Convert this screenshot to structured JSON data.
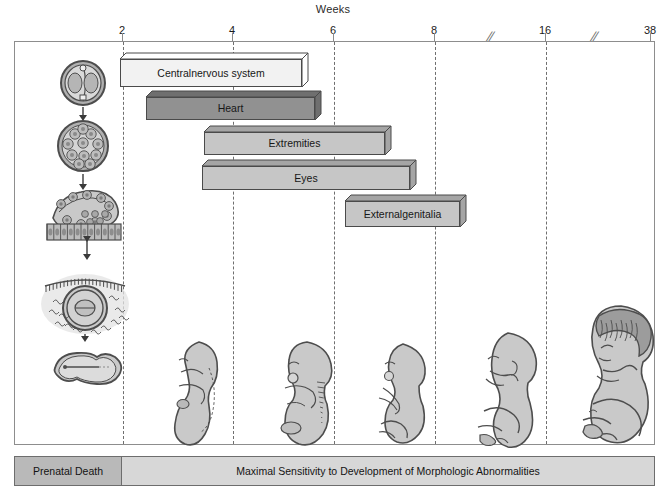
{
  "figure": {
    "axis_title": "Weeks",
    "bottom_bands": {
      "left_label": "Prenatal Death",
      "right_label": "Maximal Sensitivity to Development of Morphologic Abnormalities"
    }
  },
  "chart_data": {
    "type": "bar",
    "title": "Weeks",
    "xlabel": "Weeks",
    "ylabel": "",
    "orientation": "horizontal",
    "grid": true,
    "legend_position": "none",
    "axis_ticks": [
      {
        "label": "2",
        "x_px": 122
      },
      {
        "label": "4",
        "x_px": 232
      },
      {
        "label": "6",
        "x_px": 333
      },
      {
        "label": "8",
        "x_px": 434
      },
      {
        "label": "16",
        "x_px": 545
      },
      {
        "label": "38",
        "x_px": 650
      }
    ],
    "axis_breaks_px": [
      490,
      594
    ],
    "categories": [
      "Central nervous system",
      "Heart",
      "Extremities",
      "Eyes",
      "External genitalia"
    ],
    "bars": [
      {
        "label": "Central nervous system",
        "label_lines": [
          "Central",
          "nervous system"
        ],
        "start_week": 3.0,
        "end_week": 6.7,
        "x_px": 119,
        "width_px": 188,
        "y_px": 52,
        "height_px": 34,
        "fill": "#f2f2f2",
        "shade": "#ffffff"
      },
      {
        "label": "Heart",
        "label_lines": [
          "Heart"
        ],
        "start_week": 3.5,
        "end_week": 7.0,
        "x_px": 145,
        "width_px": 175,
        "y_px": 90,
        "height_px": 29,
        "fill": "#919191",
        "shade": "#6f6f6f"
      },
      {
        "label": "Extremities",
        "label_lines": [
          "Extremities"
        ],
        "start_week": 4.6,
        "end_week": 8.2,
        "x_px": 203,
        "width_px": 187,
        "y_px": 125,
        "height_px": 29,
        "fill": "#c6c6c6",
        "shade": "#a5a5a5"
      },
      {
        "label": "Eyes",
        "label_lines": [
          "Eyes"
        ],
        "start_week": 4.6,
        "end_week": 8.7,
        "x_px": 201,
        "width_px": 214,
        "y_px": 159,
        "height_px": 30,
        "fill": "#c6c6c6",
        "shade": "#a5a5a5"
      },
      {
        "label": "External genitalia",
        "label_lines": [
          "External",
          "genitalia"
        ],
        "start_week": 6.8,
        "end_week": 9.8,
        "x_px": 344,
        "width_px": 121,
        "y_px": 194,
        "height_px": 32,
        "fill": "#c6c6c6",
        "shade": "#a5a5a5"
      }
    ],
    "stage_illustrations": [
      {
        "name": "zygote",
        "stage": "zygote"
      },
      {
        "name": "morula",
        "stage": "morula"
      },
      {
        "name": "implanting-blastocyst",
        "stage": "blastocyst"
      },
      {
        "name": "implanted-embryo",
        "stage": "implanted embryo"
      },
      {
        "name": "bilaminar-disc",
        "stage": "embryonic disc"
      },
      {
        "name": "embryo-week3",
        "stage": "week 3 embryo"
      },
      {
        "name": "embryo-week4",
        "stage": "week 4 embryo"
      },
      {
        "name": "embryo-week5",
        "stage": "week 5 embryo"
      },
      {
        "name": "fetus-week8",
        "stage": "week 8 fetus"
      },
      {
        "name": "fetus-term",
        "stage": "term fetus"
      }
    ]
  },
  "colors": {
    "frame": "#8d8d8d",
    "gridline": "#6f6f6f",
    "band_left": "#b9b9b9",
    "band_right": "#d7d7d7",
    "text": "#171717",
    "illustration_fill": "#c9c9c9"
  }
}
